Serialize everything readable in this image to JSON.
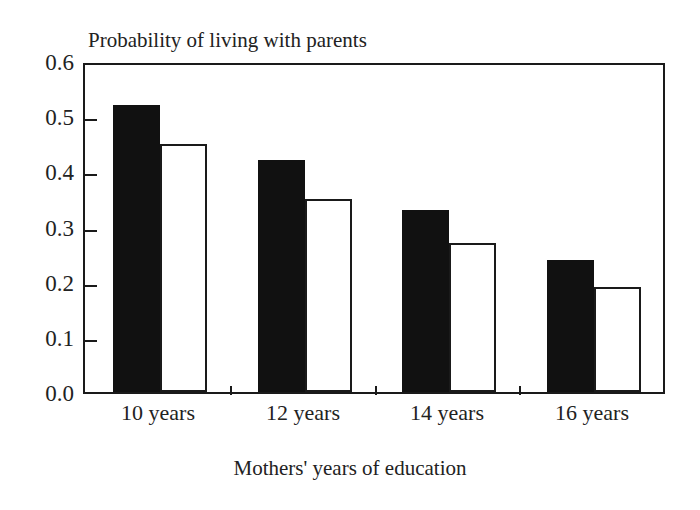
{
  "chart_data": {
    "type": "bar",
    "title": "Probability of living with parents",
    "xlabel": "Mothers' years of education",
    "ylabel": "",
    "categories": [
      "10 years",
      "12 years",
      "14 years",
      "16 years"
    ],
    "series": [
      {
        "name": "dark",
        "values": [
          0.52,
          0.42,
          0.33,
          0.24
        ],
        "color": "#111111"
      },
      {
        "name": "light",
        "values": [
          0.45,
          0.35,
          0.27,
          0.19
        ],
        "color": "#ffffff"
      }
    ],
    "ylim": [
      0.0,
      0.6
    ],
    "ytick_labels": [
      "0.6",
      "0.5",
      "0.4",
      "0.3",
      "0.2",
      "0.1",
      "0.0"
    ],
    "ytick_values": [
      0.6,
      0.5,
      0.4,
      0.3,
      0.2,
      0.1,
      0.0
    ],
    "grid": false,
    "legend": null,
    "frame": true,
    "axis_color": "#1a1a1a"
  }
}
